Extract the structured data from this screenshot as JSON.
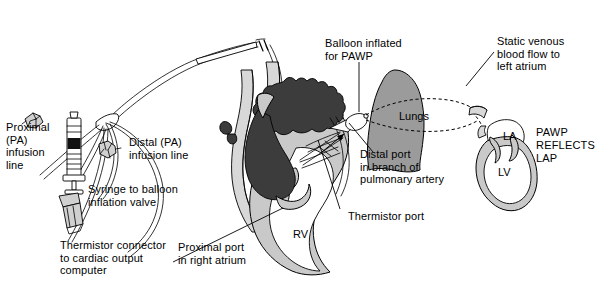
{
  "figure": {
    "type": "medical-diagram",
    "background_color": "#ffffff",
    "line_color": "#000000",
    "colors": {
      "dark_chamber": "#3c3c3c",
      "lung_fill": "#9b9b9b",
      "myocardium_fill": "#c9c9c9",
      "vessel_fill": "#d8d8d8",
      "white": "#ffffff"
    }
  },
  "labels": {
    "proximal_infusion": "Proximal\n(PA)\ninfusion\nline",
    "distal_infusion": "Distal (PA)\ninfusion line",
    "syringe": "Syringe to balloon\ninflation valve",
    "thermistor_connector": "Thermistor connector\nto cardiac output\ncomputer",
    "proximal_port": "Proximal port\nin right atrium",
    "balloon_inflated": "Balloon inflated\nfor PAWP",
    "distal_port": "Distal port\nin branch of\npulmonary artery",
    "thermistor_port": "Thermistor port",
    "static_venous": "Static venous\nblood flow to\nleft atrium",
    "pawp_reflects_lap": "PAWP\nREFLECTS\nLAP"
  },
  "anatomy_tags": {
    "lungs": "Lungs",
    "right_ventricle": "RV",
    "left_atrium": "LA",
    "left_ventricle": "LV"
  }
}
